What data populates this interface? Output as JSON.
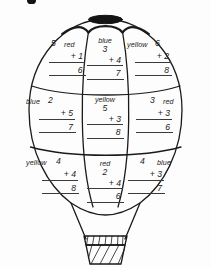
{
  "worksheet": {
    "type": "color-by-number-addition",
    "figure": "hot-air-balloon",
    "page_mark": "",
    "colors_used": [
      "red",
      "blue",
      "yellow"
    ],
    "cells": [
      {
        "id": "top-left",
        "position": "top-left",
        "color_word": "red",
        "color_hex": "#1a1a1a",
        "top_number": "5",
        "addend": "+ 1",
        "answer": "6",
        "word_placement": "right-of-number"
      },
      {
        "id": "top-center",
        "position": "top-center",
        "color_word": "blue",
        "color_hex": "#1a1a1a",
        "top_number": "3",
        "addend": "+ 4",
        "answer": "7",
        "word_placement": "above-number"
      },
      {
        "id": "top-right",
        "position": "top-right",
        "color_word": "yellow",
        "color_hex": "#1a1a1a",
        "top_number": "6",
        "addend": "+ 2",
        "answer": "8",
        "word_placement": "left-of-number"
      },
      {
        "id": "middle-left",
        "position": "middle-left",
        "color_word": "blue",
        "color_hex": "#1a1a1a",
        "top_number": "2",
        "addend": "+ 5",
        "answer": "7",
        "word_placement": "left-of-number"
      },
      {
        "id": "middle-center",
        "position": "middle-center",
        "color_word": "yellow",
        "color_hex": "#1a1a1a",
        "top_number": "5",
        "addend": "+ 3",
        "answer": "8",
        "word_placement": "above-number"
      },
      {
        "id": "middle-right",
        "position": "middle-right",
        "color_word": "red",
        "color_hex": "#1a1a1a",
        "top_number": "3",
        "addend": "+ 3",
        "answer": "6",
        "word_placement": "right-of-number"
      },
      {
        "id": "bottom-left",
        "position": "bottom-left",
        "color_word": "yellow",
        "color_hex": "#1a1a1a",
        "top_number": "4",
        "addend": "+ 4",
        "answer": "8",
        "word_placement": "left-of-number"
      },
      {
        "id": "bottom-center",
        "position": "bottom-center",
        "color_word": "red",
        "color_hex": "#1a1a1a",
        "top_number": "2",
        "addend": "+ 4",
        "answer": "6",
        "word_placement": "above-number"
      },
      {
        "id": "bottom-right",
        "position": "bottom-right",
        "color_word": "blue",
        "color_hex": "#1a1a1a",
        "top_number": "4",
        "addend": "+ 3",
        "answer": "7",
        "word_placement": "right-of-number"
      }
    ]
  }
}
